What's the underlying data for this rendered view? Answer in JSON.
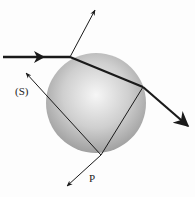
{
  "diagram": {
    "labels": {
      "s_label": "(S)",
      "p_label": "P"
    },
    "colors": {
      "sphere_light": "#f4f4f4",
      "sphere_dark": "#9a9a9a",
      "ray": "#1a1a1a"
    },
    "elements": [
      "incident-ray",
      "reflected-ray",
      "refracted-ray-inside",
      "exit-ray",
      "internal-reflection-segment",
      "ray-S",
      "ray-P",
      "sphere"
    ]
  }
}
